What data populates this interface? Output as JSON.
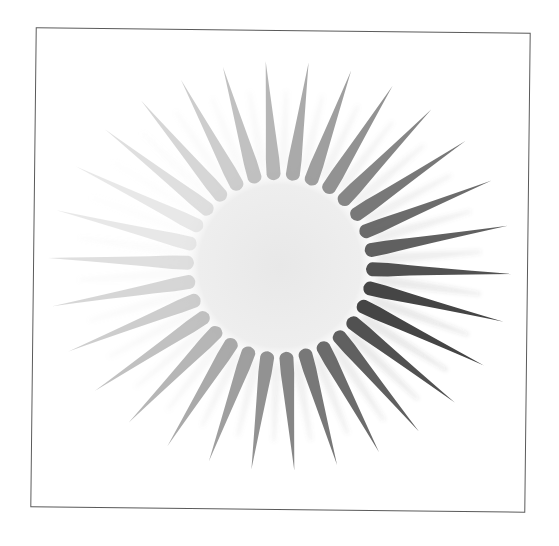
{
  "graphic": {
    "type": "sunburst",
    "frame": {
      "border_color": "#5a5a5a",
      "background": "#ffffff",
      "rotation_deg": 0.65
    },
    "center": {
      "x": 280,
      "y": 266
    },
    "disk": {
      "radius": 98,
      "color_inner": "#e9e9e9",
      "color_outer": "#f2f2f2"
    },
    "rays": {
      "count": 30,
      "start_angle_deg": -94,
      "inner_radius": 86,
      "outer_radius_min": 205,
      "outer_radius_max": 232,
      "base_half_width": 7,
      "halo_opacity": 0.12,
      "light_direction_deg": 20,
      "darkest_color": "#3c3c3c",
      "lightest_color": "#e2e2e2"
    }
  }
}
